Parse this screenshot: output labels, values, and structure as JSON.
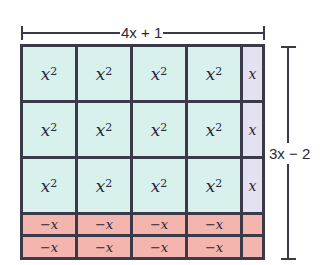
{
  "diagram": {
    "type": "algebra-tiles-area-model",
    "width_label": "4x + 1",
    "height_label": "3x − 2",
    "colors": {
      "x_squared_tile": "#d8f1ed",
      "x_tile": "#e4e1f3",
      "negative_tile": "#f3b5ae",
      "border": "#3b3a48"
    },
    "tiles": {
      "x_squared": "x",
      "x_squared_exp": "2",
      "x": "x",
      "neg_x": "−x",
      "neg_unit": ""
    },
    "rows": [
      [
        "x²",
        "x²",
        "x²",
        "x²",
        "x"
      ],
      [
        "x²",
        "x²",
        "x²",
        "x²",
        "x"
      ],
      [
        "x²",
        "x²",
        "x²",
        "x²",
        "x"
      ],
      [
        "−x",
        "−x",
        "−x",
        "−x",
        "−1"
      ],
      [
        "−x",
        "−x",
        "−x",
        "−x",
        "−1"
      ]
    ]
  }
}
